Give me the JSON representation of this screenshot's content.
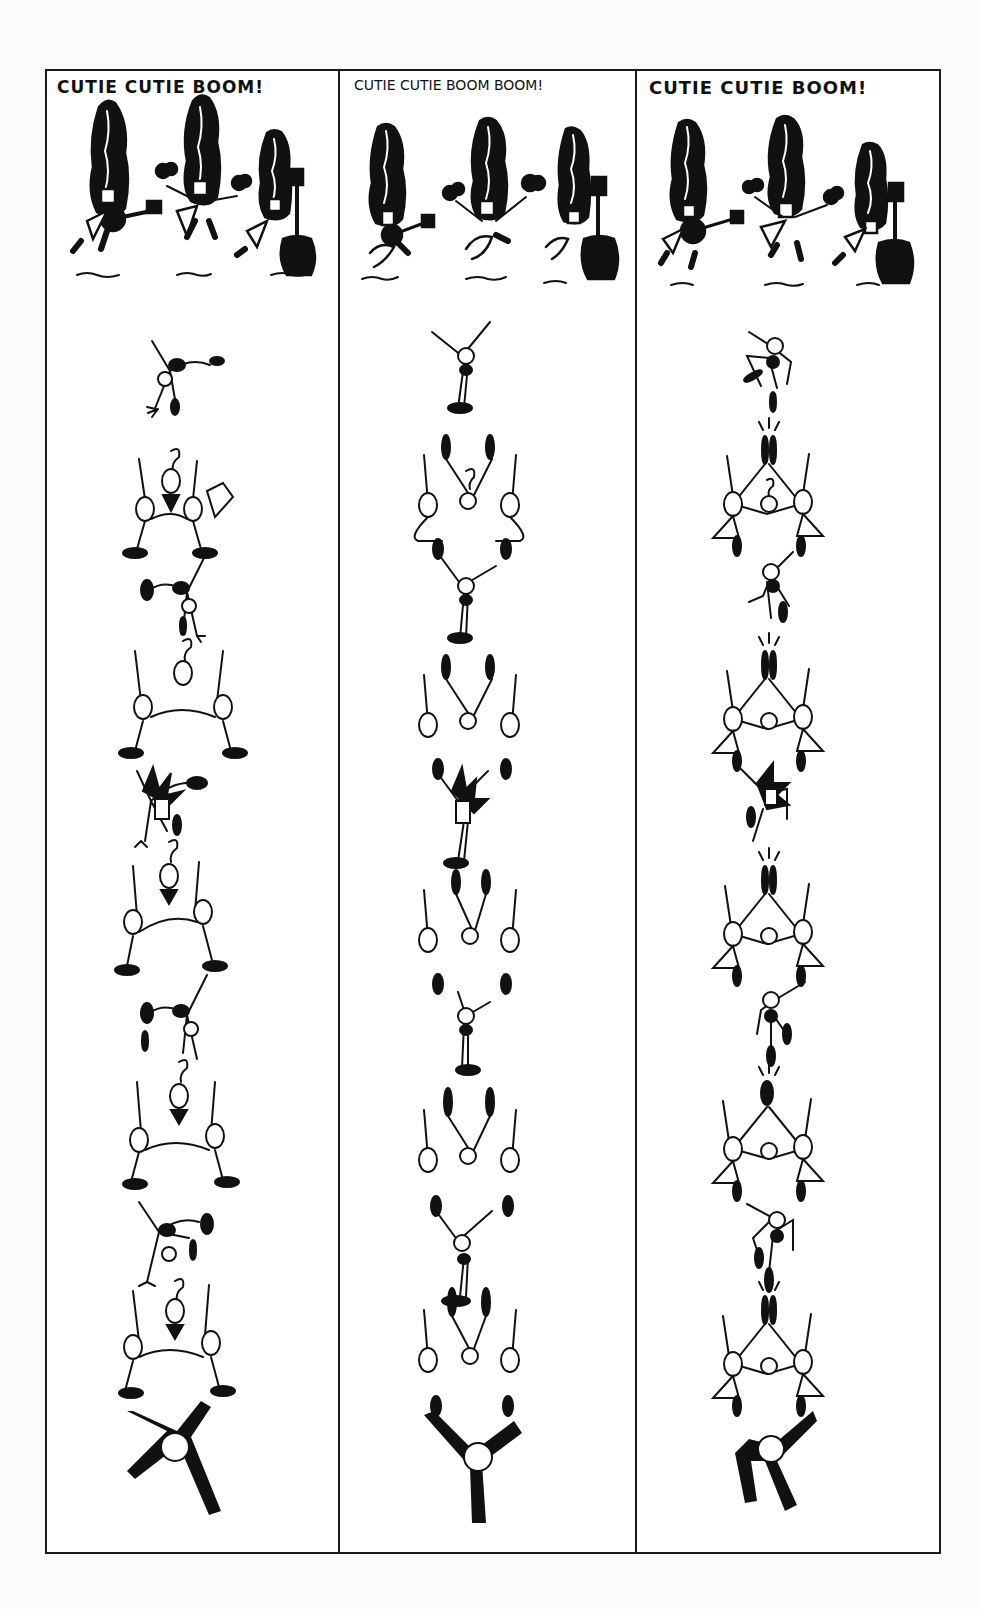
{
  "page": {
    "type": "comic-strip-page",
    "background": "#ffffff",
    "ink_color": "#111111"
  },
  "columns": [
    {
      "title": "CUTIE CUTIE BOOM!",
      "header_scene": [
        "guitar-player",
        "maracas-player",
        "upright-bass-player"
      ],
      "sequence": [
        "acrobat-cartwheel",
        "pyramid-trio",
        "acrobat-cartwheel",
        "pyramid-trio",
        "acrobat-spiky-hair",
        "pyramid-trio",
        "acrobat-cartwheel",
        "pyramid-trio",
        "acrobat-handstand",
        "pyramid-trio",
        "tumbling-figure"
      ]
    },
    {
      "title": "CUTIE CUTIE BOOM BOOM!",
      "header_scene": [
        "guitar-player",
        "maracas-player",
        "upright-bass-player"
      ],
      "sequence": [
        "acrobat-standing",
        "pyramid-handstand",
        "acrobat-standing",
        "pyramid-handstand",
        "acrobat-spiky-hair",
        "pyramid-handstand",
        "acrobat-standing",
        "pyramid-handstand",
        "acrobat-jumping",
        "pyramid-handstand",
        "tumbling-figure"
      ]
    },
    {
      "title": "CUTIE CUTIE BOOM!",
      "header_scene": [
        "guitar-player",
        "maracas-player",
        "upright-bass-player"
      ],
      "sequence": [
        "acrobat-kicking",
        "pyramid-impact",
        "acrobat-kicking",
        "pyramid-impact",
        "acrobat-spiky-hair",
        "pyramid-impact",
        "acrobat-kicking",
        "pyramid-impact",
        "acrobat-kicking",
        "pyramid-impact",
        "tumbling-figure"
      ]
    }
  ]
}
